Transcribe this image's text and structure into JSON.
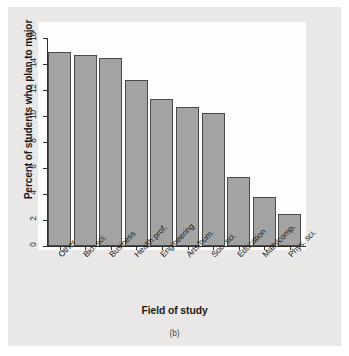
{
  "chart_data": {
    "type": "bar",
    "title": "",
    "xlabel": "Field of study",
    "ylabel": "Percent of students who plan to major",
    "categories": [
      "Other",
      "Bio. sci.",
      "Business",
      "Health prof.",
      "Engineering",
      "Arts/hum.",
      "Soc. sci.",
      "Education",
      "Math/comp.",
      "Phys. sci."
    ],
    "values": [
      14.9,
      14.7,
      14.5,
      12.8,
      11.3,
      10.7,
      10.2,
      5.3,
      3.8,
      2.5
    ],
    "ylim": [
      0,
      16
    ],
    "yticks": [
      0,
      2,
      4,
      6,
      8,
      10,
      12,
      14,
      16
    ],
    "ytick_labels": [
      "0",
      "2",
      "4",
      "6",
      "8",
      "10",
      "12",
      "14",
      "16"
    ],
    "grid": false,
    "legend": null,
    "bar_color": "#a3a3a3",
    "bar_edge_color": "#4a4a4a",
    "axis_color": "#2e2e2e",
    "plot_background": "#fdfdfd",
    "page_background": "#e9e8e6"
  },
  "caption": "(b)"
}
